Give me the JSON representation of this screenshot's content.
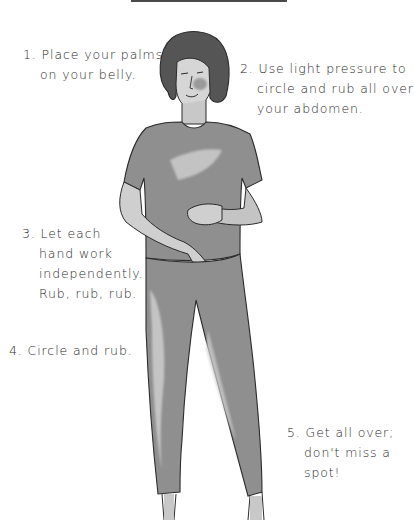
{
  "illustration": {
    "subject": "woman-rubbing-belly",
    "colors": {
      "ink": "#2b2b2b",
      "wash": "#8f8f8f",
      "wash_light": "#bdbdbd",
      "hair": "#555555"
    }
  },
  "steps": [
    {
      "number": "1.",
      "lines": [
        "Place your palms",
        "on your belly."
      ]
    },
    {
      "number": "2.",
      "lines": [
        "Use light pressure to",
        "circle and rub all over",
        "your abdomen."
      ]
    },
    {
      "number": "3.",
      "lines": [
        "Let each",
        "hand work",
        "independently.",
        "Rub, rub, rub."
      ]
    },
    {
      "number": "4.",
      "lines": [
        "Circle and rub."
      ]
    },
    {
      "number": "5.",
      "lines": [
        "Get all over;",
        "don't miss a",
        "spot!"
      ]
    }
  ]
}
